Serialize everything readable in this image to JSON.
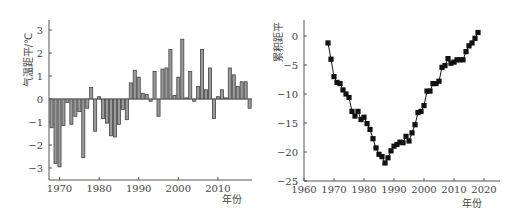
{
  "chart_data": [
    {
      "type": "bar",
      "title": "",
      "xlabel": "年份",
      "ylabel": "气温距平/℃",
      "ylim": [
        -3.5,
        3.5
      ],
      "xlim": [
        1968,
        2018
      ],
      "yticks": [
        -3,
        -2,
        -1,
        0,
        1,
        2,
        3
      ],
      "xticks": [
        1970,
        1980,
        1990,
        2000,
        2010
      ],
      "grid": false,
      "x": [
        1968,
        1969,
        1970,
        1971,
        1972,
        1973,
        1974,
        1975,
        1976,
        1977,
        1978,
        1979,
        1980,
        1981,
        1982,
        1983,
        1984,
        1985,
        1986,
        1987,
        1988,
        1989,
        1990,
        1991,
        1992,
        1993,
        1994,
        1995,
        1996,
        1997,
        1998,
        1999,
        2000,
        2001,
        2002,
        2003,
        2004,
        2005,
        2006,
        2007,
        2008,
        2009,
        2010,
        2011,
        2012,
        2013,
        2014,
        2015,
        2016,
        2017,
        2018
      ],
      "values": [
        -1.25,
        -2.8,
        -2.95,
        -1.15,
        -0.15,
        -1.1,
        -0.75,
        -0.55,
        -2.55,
        -0.4,
        0.5,
        -1.4,
        0.1,
        -0.85,
        -1.05,
        -1.6,
        -1.65,
        -1.1,
        -0.45,
        -0.9,
        0.7,
        1.25,
        0.95,
        0.25,
        0.2,
        -0.1,
        1.2,
        -0.75,
        1.3,
        1.35,
        2.15,
        0.15,
        0.95,
        2.6,
        0.05,
        1.2,
        -0.1,
        0.55,
        2.15,
        0.4,
        1.35,
        -0.85,
        0.1,
        0.4,
        0.05,
        1.35,
        1.05,
        0.55,
        0.75,
        0.75,
        -0.4
      ]
    },
    {
      "type": "line",
      "title": "",
      "xlabel": "年份",
      "ylabel": "累积距平",
      "ylim": [
        -25,
        2
      ],
      "xlim": [
        1960,
        2025
      ],
      "yticks": [
        -25,
        -20,
        -15,
        -10,
        -5,
        0
      ],
      "xticks": [
        1960,
        1970,
        1980,
        1990,
        2000,
        2010,
        2020
      ],
      "grid": false,
      "marker": "square",
      "x": [
        1968,
        1969,
        1970,
        1971,
        1972,
        1973,
        1974,
        1975,
        1976,
        1977,
        1978,
        1979,
        1980,
        1981,
        1982,
        1983,
        1984,
        1985,
        1986,
        1987,
        1988,
        1989,
        1990,
        1991,
        1992,
        1993,
        1994,
        1995,
        1996,
        1997,
        1998,
        1999,
        2000,
        2001,
        2002,
        2003,
        2004,
        2005,
        2006,
        2007,
        2008,
        2009,
        2010,
        2011,
        2012,
        2013,
        2014,
        2015,
        2016,
        2017,
        2018
      ],
      "values": [
        -1.2,
        -4.0,
        -7.0,
        -8.0,
        -8.2,
        -9.3,
        -10.0,
        -10.6,
        -13.0,
        -13.8,
        -13.0,
        -14.4,
        -14.0,
        -15.1,
        -16.1,
        -17.7,
        -19.3,
        -20.4,
        -20.8,
        -21.9,
        -21.0,
        -19.8,
        -19.0,
        -18.7,
        -18.3,
        -18.4,
        -17.3,
        -18.1,
        -16.7,
        -15.3,
        -13.2,
        -13.0,
        -12.0,
        -9.5,
        -9.5,
        -8.2,
        -8.2,
        -7.8,
        -5.4,
        -5.1,
        -3.9,
        -4.7,
        -4.5,
        -4.1,
        -4.1,
        -4.1,
        -2.7,
        -1.7,
        -1.2,
        -0.4,
        0.6,
        0.1
      ]
    }
  ]
}
